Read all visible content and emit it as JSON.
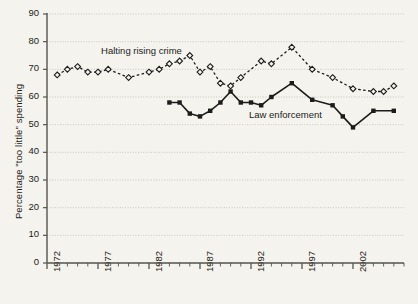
{
  "chart_data": {
    "type": "line",
    "title": "",
    "xlabel": "",
    "ylabel": "Percentage \"too little\" spending",
    "xlim": [
      1972,
      2007
    ],
    "ylim": [
      0,
      90
    ],
    "ytick_labels": [
      "0",
      "10",
      "20",
      "30",
      "40",
      "50",
      "60",
      "70",
      "80",
      "90"
    ],
    "ytick_values": [
      0,
      10,
      20,
      30,
      40,
      50,
      60,
      70,
      80,
      90
    ],
    "xtick_labels": [
      "1972",
      "1977",
      "1982",
      "1987",
      "1992",
      "1997",
      "2002"
    ],
    "xtick_values": [
      1972,
      1977,
      1982,
      1987,
      1992,
      1997,
      2002
    ],
    "grid": true,
    "legend_position": "inline-annotation",
    "series": [
      {
        "name": "Halting rising crime",
        "style": "dashed",
        "marker": "open-diamond",
        "color": "#1c1c1a",
        "points": [
          [
            1973,
            68
          ],
          [
            1974,
            70
          ],
          [
            1975,
            71
          ],
          [
            1976,
            69
          ],
          [
            1977,
            69
          ],
          [
            1978,
            70
          ],
          [
            1980,
            67
          ],
          [
            1982,
            69
          ],
          [
            1983,
            70
          ],
          [
            1984,
            72
          ],
          [
            1985,
            73
          ],
          [
            1986,
            75
          ],
          [
            1987,
            69
          ],
          [
            1988,
            71
          ],
          [
            1989,
            65
          ],
          [
            1990,
            64
          ],
          [
            1991,
            67
          ],
          [
            1993,
            73
          ],
          [
            1994,
            72
          ],
          [
            1996,
            78
          ],
          [
            1998,
            70
          ],
          [
            2000,
            67
          ],
          [
            2002,
            63
          ],
          [
            2004,
            62
          ],
          [
            2005,
            62
          ],
          [
            2006,
            64
          ]
        ]
      },
      {
        "name": "Law enforcement",
        "style": "solid",
        "marker": "filled-square",
        "color": "#1c1c1a",
        "points": [
          [
            1984,
            58
          ],
          [
            1985,
            58
          ],
          [
            1986,
            54
          ],
          [
            1987,
            53
          ],
          [
            1988,
            55
          ],
          [
            1989,
            58
          ],
          [
            1990,
            62
          ],
          [
            1991,
            58
          ],
          [
            1992,
            58
          ],
          [
            1993,
            57
          ],
          [
            1994,
            60
          ],
          [
            1996,
            65
          ],
          [
            1998,
            59
          ],
          [
            2000,
            57
          ],
          [
            2001,
            53
          ],
          [
            2002,
            49
          ],
          [
            2004,
            55
          ],
          [
            2006,
            55
          ]
        ]
      }
    ],
    "annotations": [
      {
        "text": "Halting rising crime",
        "x": 1977.5,
        "y": 76.5
      },
      {
        "text": "Law enforcement",
        "x": 1992.0,
        "y": 53.5
      }
    ]
  }
}
